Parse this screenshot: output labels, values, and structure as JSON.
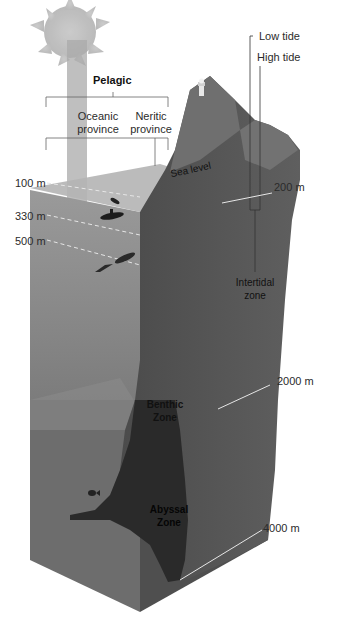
{
  "diagram": {
    "type": "ocean-zones-cross-section",
    "header": {
      "pelagic": "Pelagic",
      "oceanic_province": [
        "Oceanic",
        "province"
      ],
      "neritic_province": [
        "Neritic",
        "province"
      ]
    },
    "tides": {
      "low_tide": "Low tide",
      "high_tide": "High tide",
      "intertidal_zone": [
        "Intertidal",
        "zone"
      ]
    },
    "surface": {
      "sea_level": "Sea level"
    },
    "depth_markers_left": [
      {
        "label": "100 m"
      },
      {
        "label": "330 m"
      },
      {
        "label": "500 m"
      }
    ],
    "depth_markers_right": [
      {
        "label": "200 m"
      },
      {
        "label": "2000 m"
      },
      {
        "label": "4000 m"
      }
    ],
    "zones": {
      "benthic": [
        "Benthic",
        "Zone"
      ],
      "abyssal": [
        "Abyssal",
        "Zone"
      ]
    },
    "icons": [
      "sun-icon",
      "lighthouse-icon",
      "diver-icon",
      "submarine-icon",
      "squid-icon",
      "fish-icon"
    ],
    "colors": {
      "water_front": "#8e8e8e",
      "water_top": "#a9a9a9",
      "rock_front": "#5e5e5e",
      "rock_dark": "#3a3a3a",
      "trench": "#262626",
      "sun": "#bdbdbd",
      "depth_line": "#e6e6e6"
    }
  }
}
